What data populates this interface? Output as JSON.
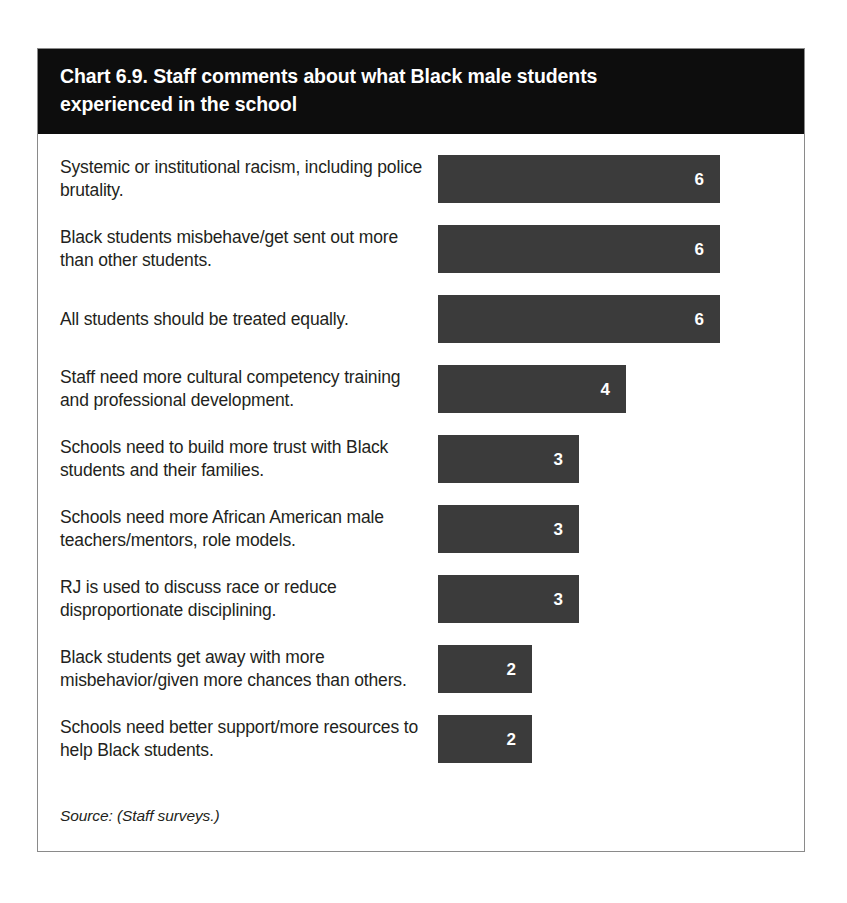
{
  "chart_card": {
    "title": "Chart 6.9. Staff comments about what Black male students experienced in the school",
    "source": "Source: (Staff surveys.)"
  },
  "chart_data": {
    "type": "bar",
    "orientation": "horizontal",
    "title": "Chart 6.9. Staff comments about what Black male students experienced in the school",
    "xlabel": "",
    "ylabel": "",
    "xlim": [
      0,
      6
    ],
    "grid": false,
    "legend": false,
    "data_labels": true,
    "bar_color": "#3b3b3b",
    "value_label_color": "#ffffff",
    "header_background": "#0d0d0d",
    "categories": [
      "Systemic or institutional racism, including police brutality.",
      "Black students misbehave/get sent out more than other students.",
      "All students should be treated equally.",
      "Staff need more cultural competency training and professional development.",
      "Schools need to build more trust with Black students and their families.",
      "Schools need more African American male teachers/mentors, role models.",
      "RJ is used to discuss race or reduce disproportionate disciplining.",
      "Black students get away with more misbehavior/given more chances than others.",
      "Schools need better support/more resources to help Black students."
    ],
    "values": [
      6,
      6,
      6,
      4,
      3,
      3,
      3,
      2,
      2
    ],
    "value_labels": [
      "6",
      "6",
      "6",
      "4",
      "3",
      "3",
      "3",
      "2",
      "2"
    ]
  },
  "rows": [
    {
      "label": "Systemic or institutional racism, including police brutality.",
      "value": "6"
    },
    {
      "label": "Black students misbehave/get sent out more than other students.",
      "value": "6"
    },
    {
      "label": "All students should be treated equally.",
      "value": "6"
    },
    {
      "label": "Staff need more cultural competency training and professional development.",
      "value": "4"
    },
    {
      "label": "Schools need to build more trust with Black students and their families.",
      "value": "3"
    },
    {
      "label": "Schools need more African American male teachers/mentors, role models.",
      "value": "3"
    },
    {
      "label": "RJ is used to discuss race or reduce disproportionate disciplining.",
      "value": "3"
    },
    {
      "label": "Black students get away with more misbehavior/given more chances than others.",
      "value": "2"
    },
    {
      "label": "Schools need better support/more resources to help Black students.",
      "value": "2"
    }
  ]
}
